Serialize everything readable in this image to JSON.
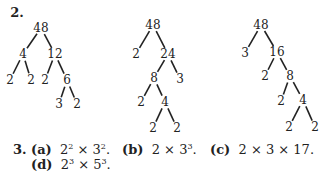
{
  "problem2": {
    "label": "2.",
    "trees": [
      {
        "nodes": [
          {
            "id": "a",
            "value": "48",
            "x": 41,
            "y": 28
          },
          {
            "id": "b",
            "value": "4",
            "x": 23,
            "y": 54
          },
          {
            "id": "c",
            "value": "12",
            "x": 55,
            "y": 54
          },
          {
            "id": "d",
            "value": "2",
            "x": 10,
            "y": 80
          },
          {
            "id": "e",
            "value": "2",
            "x": 31,
            "y": 80
          },
          {
            "id": "f",
            "value": "2",
            "x": 45,
            "y": 80
          },
          {
            "id": "g",
            "value": "6",
            "x": 67,
            "y": 80
          },
          {
            "id": "h",
            "value": "3",
            "x": 59,
            "y": 104
          },
          {
            "id": "i",
            "value": "2",
            "x": 77,
            "y": 104
          }
        ],
        "edges": [
          [
            "a",
            "b"
          ],
          [
            "a",
            "c"
          ],
          [
            "b",
            "d"
          ],
          [
            "b",
            "e"
          ],
          [
            "c",
            "f"
          ],
          [
            "c",
            "g"
          ],
          [
            "g",
            "h"
          ],
          [
            "g",
            "i"
          ]
        ]
      },
      {
        "nodes": [
          {
            "id": "a",
            "value": "48",
            "x": 153,
            "y": 25
          },
          {
            "id": "b",
            "value": "2",
            "x": 136,
            "y": 54
          },
          {
            "id": "c",
            "value": "24",
            "x": 168,
            "y": 54
          },
          {
            "id": "d",
            "value": "8",
            "x": 154,
            "y": 78
          },
          {
            "id": "e",
            "value": "3",
            "x": 180,
            "y": 79
          },
          {
            "id": "f",
            "value": "2",
            "x": 141,
            "y": 102
          },
          {
            "id": "g",
            "value": "4",
            "x": 165,
            "y": 102
          },
          {
            "id": "h",
            "value": "2",
            "x": 153,
            "y": 128
          },
          {
            "id": "i",
            "value": "2",
            "x": 177,
            "y": 128
          }
        ],
        "edges": [
          [
            "a",
            "b"
          ],
          [
            "a",
            "c"
          ],
          [
            "c",
            "d"
          ],
          [
            "c",
            "e"
          ],
          [
            "d",
            "f"
          ],
          [
            "d",
            "g"
          ],
          [
            "g",
            "h"
          ],
          [
            "g",
            "i"
          ]
        ]
      },
      {
        "nodes": [
          {
            "id": "a",
            "value": "48",
            "x": 261,
            "y": 25
          },
          {
            "id": "b",
            "value": "3",
            "x": 245,
            "y": 53
          },
          {
            "id": "c",
            "value": "16",
            "x": 277,
            "y": 52
          },
          {
            "id": "d",
            "value": "2",
            "x": 265,
            "y": 76
          },
          {
            "id": "e",
            "value": "8",
            "x": 290,
            "y": 76
          },
          {
            "id": "f",
            "value": "2",
            "x": 281,
            "y": 101
          },
          {
            "id": "g",
            "value": "4",
            "x": 303,
            "y": 100
          },
          {
            "id": "h",
            "value": "2",
            "x": 289,
            "y": 127
          },
          {
            "id": "i",
            "value": "2",
            "x": 315,
            "y": 127
          }
        ],
        "edges": [
          [
            "a",
            "b"
          ],
          [
            "a",
            "c"
          ],
          [
            "c",
            "d"
          ],
          [
            "c",
            "e"
          ],
          [
            "e",
            "f"
          ],
          [
            "e",
            "g"
          ],
          [
            "g",
            "h"
          ],
          [
            "g",
            "i"
          ]
        ]
      }
    ]
  },
  "problem3": {
    "label": "3.",
    "answers": [
      {
        "part": "(a)",
        "base1": "2",
        "exp1": "2",
        "op": "×",
        "base2": "3",
        "exp2": "2",
        "end": "."
      },
      {
        "part": "(b)",
        "base1": "2",
        "op": "×",
        "base2": "3",
        "exp2": "3",
        "end": "."
      },
      {
        "part": "(c)",
        "text": "2 × 3 × 17."
      },
      {
        "part": "(d)",
        "base1": "2",
        "exp1": "3",
        "op": "×",
        "base2": "5",
        "exp2": "3",
        "end": "."
      }
    ]
  }
}
